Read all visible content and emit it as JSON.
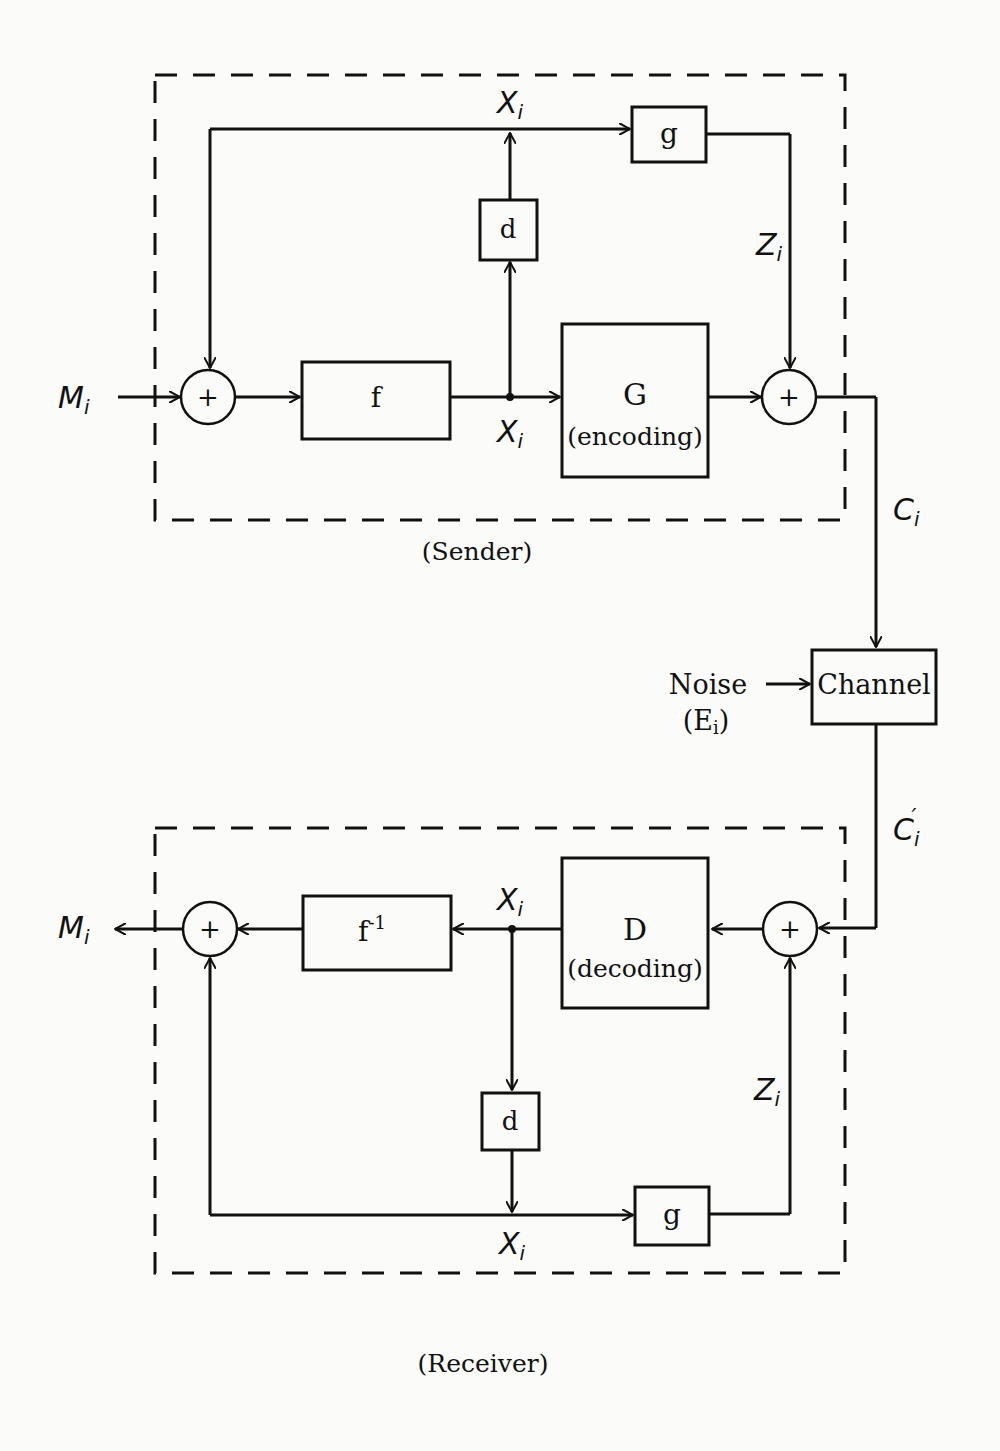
{
  "diagram": {
    "sender": {
      "caption": "(Sender)",
      "input_label": "M",
      "input_sub": "i",
      "blocks": {
        "f": "f",
        "d": "d",
        "g": "g",
        "G_name": "G",
        "G_desc": "(encoding)"
      },
      "signals": {
        "x_top": "X",
        "x_mid": "X",
        "z": "Z",
        "c": "C",
        "sub": "i"
      }
    },
    "channel": {
      "label": "Channel",
      "noise_label": "Noise",
      "noise_symbol": "(E",
      "noise_sub": "i",
      "noise_close": ")",
      "output_label": "C",
      "output_sub": "i",
      "output_prime": "′"
    },
    "receiver": {
      "caption": "(Receiver)",
      "output_label": "M",
      "output_sub": "i",
      "blocks": {
        "f_inv": "f",
        "f_inv_sup": "-1",
        "d": "d",
        "g": "g",
        "D_name": "D",
        "D_desc": "(decoding)"
      },
      "signals": {
        "x_top": "X",
        "x_bottom": "X",
        "z": "Z",
        "sub": "i"
      }
    },
    "adder_symbol": "+"
  }
}
